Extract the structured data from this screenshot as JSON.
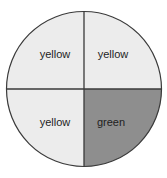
{
  "diagram": {
    "type": "quartered-circle",
    "colors": {
      "light": "#ececec",
      "dark": "#8e8e8e",
      "stroke": "#3a3a3a"
    },
    "quadrants": [
      {
        "position": "top-left",
        "label": "yellow"
      },
      {
        "position": "top-right",
        "label": "yellow"
      },
      {
        "position": "bottom-left",
        "label": "yellow"
      },
      {
        "position": "bottom-right",
        "label": "green"
      }
    ]
  }
}
